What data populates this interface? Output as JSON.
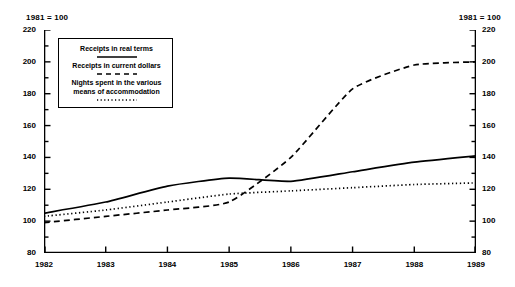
{
  "header": {
    "left_note": "1981 = 100",
    "right_note": "1981 = 100"
  },
  "legend": {
    "items": [
      {
        "label": "Receipts in real terms",
        "style": "solid"
      },
      {
        "label": "Receipts in current dollars",
        "style": "dashed"
      },
      {
        "label_line1": "Nights spent in the various",
        "label_line2": "means of accommodation",
        "style": "dotted"
      }
    ]
  },
  "axes": {
    "y_ticks": [
      "220",
      "200",
      "180",
      "160",
      "140",
      "120",
      "100",
      "80"
    ],
    "x_ticks": [
      "1982",
      "1983",
      "1984",
      "1985",
      "1986",
      "1987",
      "1988",
      "1989"
    ]
  },
  "chart_data": {
    "type": "line",
    "title": "",
    "subtitle": "",
    "xlabel": "",
    "ylabel": "",
    "note": "1981 = 100",
    "x": [
      1982,
      1983,
      1984,
      1985,
      1986,
      1987,
      1988,
      1989
    ],
    "categories": [
      "1982",
      "1983",
      "1984",
      "1985",
      "1986",
      "1987",
      "1988",
      "1989"
    ],
    "ylim": [
      80,
      220
    ],
    "xlim": [
      1982,
      1989
    ],
    "y_major_step": 20,
    "y_minor_step": 10,
    "grid": false,
    "legend_position": "upper-left-inside",
    "dual_axis": true,
    "series": [
      {
        "name": "Receipts in real terms",
        "style": "solid",
        "color": "#000000",
        "values": [
          105,
          112,
          122,
          127,
          125,
          131,
          137,
          141
        ]
      },
      {
        "name": "Receipts in current dollars",
        "style": "dashed",
        "color": "#000000",
        "values": [
          99,
          103,
          107,
          112,
          140,
          183,
          198,
          200
        ]
      },
      {
        "name": "Nights spent in the various means of accommodation",
        "style": "dotted",
        "color": "#000000",
        "values": [
          103,
          107,
          112,
          117,
          119,
          121,
          123,
          124
        ]
      }
    ]
  }
}
